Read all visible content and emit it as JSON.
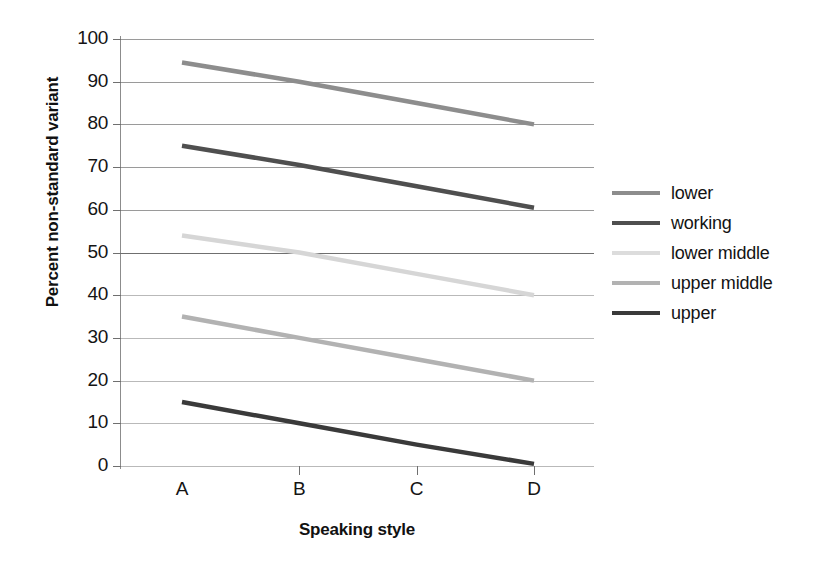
{
  "chart_data": {
    "type": "line",
    "title": "",
    "xlabel": "Speaking style",
    "ylabel": "Percent non-standard variant",
    "categories": [
      "A",
      "B",
      "C",
      "D"
    ],
    "ylim": [
      0,
      100
    ],
    "yticks": [
      0,
      10,
      20,
      30,
      40,
      50,
      60,
      70,
      80,
      90,
      100
    ],
    "grid": true,
    "legend_position": "right",
    "series": [
      {
        "name": "lower",
        "values": [
          94.5,
          90.0,
          85.0,
          80.0
        ],
        "color": "#8d8d8d"
      },
      {
        "name": "working",
        "values": [
          75.0,
          70.5,
          65.5,
          60.5
        ],
        "color": "#4f4f4f"
      },
      {
        "name": "lower middle",
        "values": [
          54.0,
          50.0,
          45.0,
          40.0
        ],
        "color": "#d6d6d6"
      },
      {
        "name": "upper middle",
        "values": [
          35.0,
          30.0,
          25.0,
          20.0
        ],
        "color": "#b2b2b2"
      },
      {
        "name": "upper",
        "values": [
          15.0,
          10.0,
          5.0,
          0.5
        ],
        "color": "#3a3a3a"
      }
    ]
  },
  "axes": {
    "y_title": "Percent non-standard variant",
    "x_title": "Speaking style",
    "y_tick_labels": [
      "100",
      "90",
      "80",
      "70",
      "60",
      "50",
      "40",
      "30",
      "20",
      "10",
      "0"
    ],
    "x_tick_labels": [
      "A",
      "B",
      "C",
      "D"
    ]
  },
  "legend": {
    "entries": [
      {
        "label": "lower",
        "color": "#8d8d8d"
      },
      {
        "label": "working",
        "color": "#4f4f4f"
      },
      {
        "label": "lower middle",
        "color": "#dcdcdc"
      },
      {
        "label": "upper middle",
        "color": "#b2b2b2"
      },
      {
        "label": "upper",
        "color": "#3a3a3a"
      }
    ]
  },
  "style": {
    "background": "#ffffff",
    "axis_color": "#8c8c8c",
    "grid_color": "#b9b9b9",
    "text_color": "#141414"
  }
}
